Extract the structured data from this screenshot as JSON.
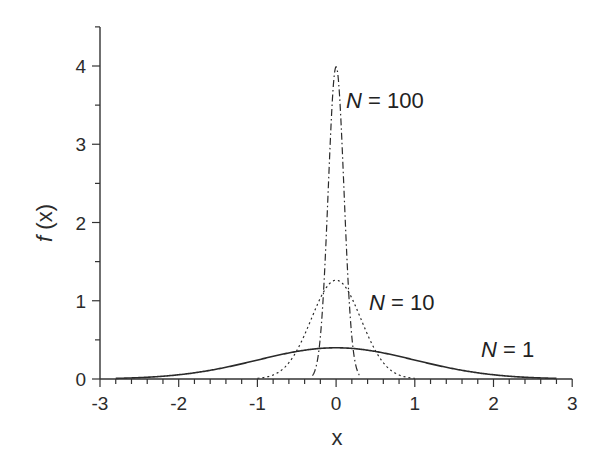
{
  "chart_data": {
    "type": "line",
    "title": "",
    "xlabel": "x",
    "ylabel": "f (x)",
    "ylabel_italic_part": "f",
    "ylabel_rest": " (x)",
    "xlim": [
      -3,
      3
    ],
    "ylim": [
      0,
      4.5
    ],
    "x_ticks": [
      -3,
      -2,
      -1,
      0,
      1,
      2,
      3
    ],
    "x_tick_labels": [
      "-3",
      "-2",
      "-1",
      "0",
      "1",
      "2",
      "3"
    ],
    "y_ticks": [
      0,
      1,
      2,
      3,
      4
    ],
    "y_tick_labels": [
      "0",
      "1",
      "2",
      "3",
      "4"
    ],
    "grid": false,
    "legend": "inline annotations",
    "series": [
      {
        "name": "N = 1",
        "N": 1,
        "style": "solid",
        "sigma": 1.0,
        "peak": 0.4,
        "x": [
          -2.8,
          -2,
          -1,
          0,
          1,
          2,
          2.8
        ],
        "values": [
          0.008,
          0.054,
          0.242,
          0.399,
          0.242,
          0.054,
          0.008
        ]
      },
      {
        "name": "N = 10",
        "N": 10,
        "style": "dotted",
        "sigma": 0.316,
        "peak": 1.26,
        "x": [
          -1,
          -0.5,
          0,
          0.5,
          1
        ],
        "values": [
          0.008,
          0.36,
          1.262,
          0.36,
          0.008
        ]
      },
      {
        "name": "N = 100",
        "N": 100,
        "style": "dash-dot",
        "sigma": 0.1,
        "peak": 3.99,
        "x": [
          -0.3,
          -0.1,
          0,
          0.1,
          0.3
        ],
        "values": [
          0.044,
          2.42,
          3.989,
          2.42,
          0.044
        ]
      }
    ],
    "annotations": [
      {
        "label_italic": "N",
        "label_rest": " = 100",
        "x": 0.04,
        "y": 3.7
      },
      {
        "label_italic": "N",
        "label_rest": " = 10",
        "x": 0.45,
        "y": 1.1
      },
      {
        "label_italic": "N",
        "label_rest": " = 1",
        "x": 1.75,
        "y": 0.4
      }
    ],
    "colors": {
      "axis": "#333333",
      "line": "#2a2a2a",
      "text": "#2b2b2b"
    }
  }
}
